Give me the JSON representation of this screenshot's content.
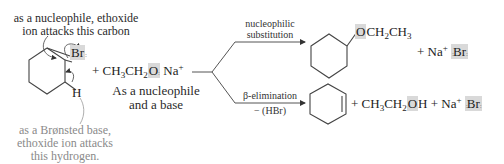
{
  "annotations": {
    "nucleophile_note_line1": "as a nucleophile, ethoxide",
    "nucleophile_note_line2": "ion attacks this carbon",
    "base_note_line1": "as a Brønsted base,",
    "base_note_line2": "ethoxide ion attacks",
    "base_note_line3": "this hydrogen.",
    "reagent_role_line1": "As a nucleophile",
    "reagent_role_line2": "and a base"
  },
  "reactant": {
    "leaving_group": "Br",
    "beta_hydrogen": "H",
    "plus": "+",
    "reagent_prefix": "CH",
    "reagent_sub1": "3",
    "reagent_mid": "CH",
    "reagent_sub2": "2",
    "reagent_O": "O",
    "counter_ion": "Na",
    "counter_charge": "+"
  },
  "pathways": {
    "substitution": {
      "label_line1": "nucleophilic",
      "label_line2": "substitution",
      "product_O": "O",
      "product_chain": "CH",
      "product_sub1": "2",
      "product_chain2": "CH",
      "product_sub2": "3",
      "plus": "+",
      "byproduct_ion": "Na",
      "byproduct_charge": "+",
      "byproduct_anion": "Br"
    },
    "elimination": {
      "label_line1": "β-elimination",
      "label_line2": "− (HBr)",
      "plus1": "+",
      "alcohol_prefix": "CH",
      "alcohol_sub1": "3",
      "alcohol_mid": "CH",
      "alcohol_sub2": "2",
      "alcohol_O": "O",
      "alcohol_H": "H",
      "plus2": "+",
      "byproduct_ion": "Na",
      "byproduct_charge": "+",
      "byproduct_anion": "Br"
    }
  },
  "colors": {
    "highlight": "#d9d9d9",
    "gray_note": "#8a8a8a",
    "ink": "#222222"
  }
}
